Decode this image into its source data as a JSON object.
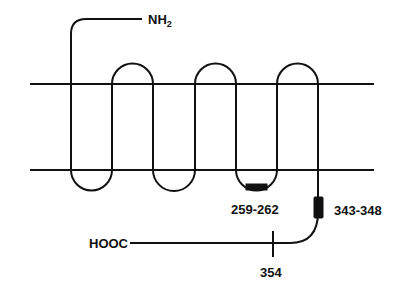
{
  "diagram": {
    "type": "membrane-topology",
    "membrane": {
      "top_y": 84,
      "bottom_y": 170,
      "x_start": 30,
      "x_end": 374
    },
    "transmembrane_segments": 7,
    "n_terminus": {
      "label": "NH",
      "subscript": "2",
      "side": "extracellular"
    },
    "c_terminus": {
      "label": "HOOC",
      "side": "intracellular"
    },
    "annotations": [
      {
        "label": "259-262",
        "location": "third intracellular loop"
      },
      {
        "label": "343-348",
        "location": "C-terminal tail near membrane"
      },
      {
        "label": "354",
        "location": "C-terminal tail tick mark"
      }
    ],
    "colors": {
      "stroke": "#111111",
      "background": "#ffffff"
    }
  }
}
